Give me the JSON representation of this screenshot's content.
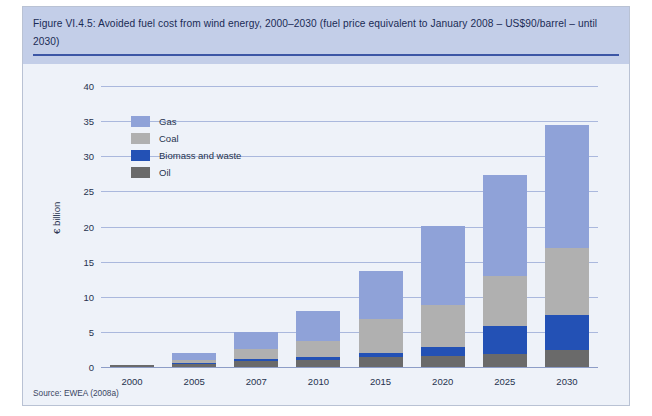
{
  "figure": {
    "title": "Figure VI.4.5: Avoided fuel cost from wind energy, 2000–2030 (fuel price equivalent to January 2008 – US$90/barrel – until 2030)",
    "source": "Source: EWEA (2008a)"
  },
  "colors": {
    "gas": "#8fa2d8",
    "coal": "#b0b0b0",
    "biomass": "#2351b5",
    "oil": "#6a6a6a",
    "title_band": "#c3cee8",
    "panel": "#eef2f9",
    "gridline": "#aab8dd",
    "title_rule": "#3c56a5"
  },
  "chart_data": {
    "type": "bar",
    "stacked": true,
    "title": "Figure VI.4.5: Avoided fuel cost from wind energy, 2000–2030 (fuel price equivalent to January 2008 – US$90/barrel – until 2030)",
    "xlabel": "",
    "ylabel": "€ billion",
    "ylim": [
      0,
      40
    ],
    "ytick_step": 5,
    "yticks": [
      0,
      5,
      10,
      15,
      20,
      25,
      30,
      35,
      40
    ],
    "ytick_labels": [
      "0",
      "5",
      "10",
      "15",
      "20",
      "25",
      "30",
      "35",
      "40"
    ],
    "grid": true,
    "legend_position": "inside-upper-left",
    "categories": [
      "2000",
      "2005",
      "2007",
      "2010",
      "2015",
      "2020",
      "2025",
      "2030"
    ],
    "series": [
      {
        "name": "Oil",
        "color": "#6a6a6a",
        "values": [
          0.3,
          0.4,
          0.9,
          1.0,
          1.4,
          1.6,
          1.9,
          2.4
        ]
      },
      {
        "name": "Biomass and waste",
        "color": "#2351b5",
        "values": [
          0.0,
          0.2,
          0.3,
          0.4,
          0.6,
          1.3,
          3.9,
          5.0
        ]
      },
      {
        "name": "Coal",
        "color": "#b0b0b0",
        "values": [
          0.0,
          0.4,
          1.4,
          2.3,
          4.9,
          5.9,
          7.2,
          9.5
        ]
      },
      {
        "name": "Gas",
        "color": "#8fa2d8",
        "values": [
          0.0,
          1.0,
          2.4,
          4.3,
          6.8,
          11.3,
          14.3,
          17.5
        ]
      }
    ],
    "totals": [
      0.3,
      2.0,
      5.0,
      8.0,
      13.7,
      20.1,
      27.3,
      34.4
    ],
    "legend_order": [
      "Gas",
      "Coal",
      "Biomass and waste",
      "Oil"
    ]
  }
}
